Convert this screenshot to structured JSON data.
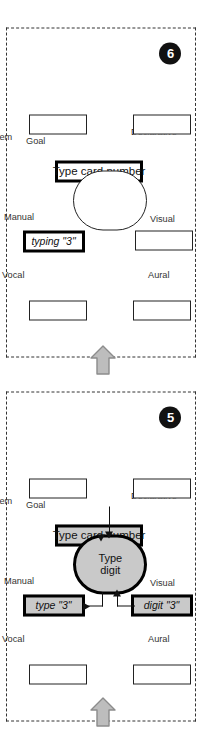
{
  "figure": {
    "orientation": "rotated-90-ccw",
    "colors": {
      "fill_active": "#c9c9c9",
      "outline": "#222222",
      "badge_bg": "#111111",
      "badge_fg": "#ffffff",
      "arrow_fill": "#bdbdbd",
      "arrow_stroke": "#8c8c8c"
    }
  },
  "panels": [
    {
      "id": "panel-6",
      "badge": "6",
      "goal": {
        "label": "Goal",
        "text": "Type card number",
        "filled": false,
        "thick": true
      },
      "central": {
        "text": "",
        "filled": false,
        "thick": false
      },
      "modules": [
        {
          "name": "Problem",
          "label": "Problem",
          "text": "",
          "filled": false,
          "thick": false,
          "italic": false
        },
        {
          "name": "Manual",
          "label": "Manual",
          "text": "typing \"3\"",
          "filled": false,
          "thick": true,
          "italic": true
        },
        {
          "name": "Vocal",
          "label": "Vocal",
          "text": "",
          "filled": false,
          "thick": false,
          "italic": false
        },
        {
          "name": "Declarative",
          "label": "Declarative",
          "text": "",
          "filled": false,
          "thick": false,
          "italic": false
        },
        {
          "name": "Visual",
          "label": "Visual",
          "text": "",
          "filled": false,
          "thick": false,
          "italic": false
        },
        {
          "name": "Aural",
          "label": "Aural",
          "text": "",
          "filled": false,
          "thick": false,
          "italic": false
        }
      ],
      "connectors": []
    },
    {
      "id": "panel-5",
      "badge": "5",
      "goal": {
        "label": "Goal",
        "text": "Type card number",
        "filled": true,
        "thick": true
      },
      "central": {
        "text_line1": "Type",
        "text_line2": "digit",
        "filled": true,
        "thick": true
      },
      "modules": [
        {
          "name": "Problem",
          "label": "Problem",
          "text": "",
          "filled": false,
          "thick": false,
          "italic": false
        },
        {
          "name": "Manual",
          "label": "Manual",
          "text": "type \"3\"",
          "filled": true,
          "thick": true,
          "italic": true
        },
        {
          "name": "Vocal",
          "label": "Vocal",
          "text": "",
          "filled": false,
          "thick": false,
          "italic": false
        },
        {
          "name": "Declarative",
          "label": "Declarative",
          "text": "",
          "filled": false,
          "thick": false,
          "italic": false
        },
        {
          "name": "Visual",
          "label": "Visual",
          "text": "digit \"3\"",
          "filled": true,
          "thick": true,
          "italic": true
        },
        {
          "name": "Aural",
          "label": "Aural",
          "text": "",
          "filled": false,
          "thick": false,
          "italic": false
        }
      ],
      "connectors": [
        {
          "from": "Goal",
          "to": "Central",
          "direction": "goal-to-central"
        },
        {
          "from": "Visual",
          "to": "Central",
          "direction": "visual-to-central"
        },
        {
          "from": "Central",
          "to": "Manual",
          "direction": "central-to-manual"
        }
      ]
    }
  ],
  "flow_arrows": [
    {
      "name": "arrow-into-panel-5",
      "direction": "up"
    },
    {
      "name": "arrow-panel-5-to-panel-6",
      "direction": "up"
    }
  ]
}
